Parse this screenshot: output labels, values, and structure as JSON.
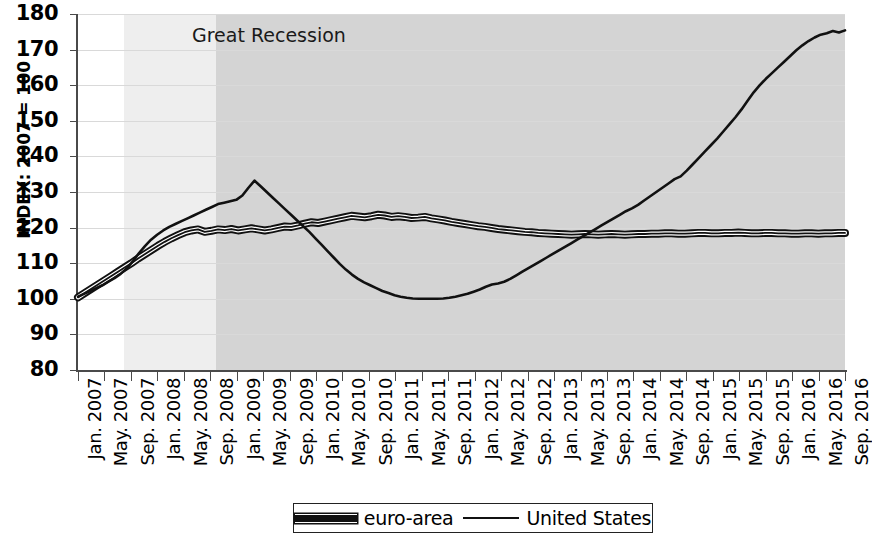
{
  "chart_data": {
    "type": "line",
    "title": "",
    "xlabel": "",
    "ylabel": "INDEX: 2007 = 100",
    "ylim": [
      80,
      180
    ],
    "ytick_values": [
      180,
      170,
      160,
      150,
      140,
      130,
      120,
      110,
      100,
      90,
      80
    ],
    "grid": true,
    "legend_position": "bottom-center",
    "tick_labels": [
      "Jan. 2007",
      "May. 2007",
      "Sep. 2007",
      "Jan. 2008",
      "May. 2008",
      "Sep. 2008",
      "Jan. 2009",
      "May. 2009",
      "Sep. 2009",
      "Jan. 2010",
      "May. 2010",
      "Sep. 2010",
      "Jan. 2011",
      "May. 2011",
      "Sep. 2011",
      "Jan. 2012",
      "May. 2012",
      "Sep. 2012",
      "Jan. 2013",
      "May. 2013",
      "Sep. 2013",
      "Jan. 2014",
      "May. 2014",
      "Sep. 2014",
      "Jan. 2015",
      "May. 2015",
      "Sep. 2015",
      "Jan. 2016",
      "May. 2016",
      "Sep. 2016"
    ],
    "x_range": [
      "Jan. 2007",
      "Sep. 2016"
    ],
    "annotations": [
      {
        "text": "Great Recession",
        "type": "shaded-band-label",
        "band_start": "Sep. 2007",
        "band_end": "Sep. 2016",
        "band_light_color": "#eeeeee",
        "band_dark_color": "#d4d4d4",
        "dark_band_start": "Sep. 2008"
      }
    ],
    "series": [
      {
        "name": "euro-area",
        "style": "thick-outlined",
        "color": "#111111",
        "values": [
          100.4,
          101.6,
          102.8,
          104.0,
          105.2,
          106.4,
          107.6,
          108.8,
          110.0,
          111.3,
          112.5,
          113.7,
          114.9,
          116.0,
          117.0,
          117.9,
          118.7,
          119.2,
          119.5,
          118.8,
          119.1,
          119.5,
          119.3,
          119.6,
          119.2,
          119.5,
          119.8,
          119.5,
          119.2,
          119.5,
          119.9,
          120.3,
          120.2,
          120.6,
          121.1,
          121.5,
          121.3,
          121.7,
          122.1,
          122.5,
          122.9,
          123.3,
          123.1,
          122.9,
          123.2,
          123.6,
          123.4,
          123.0,
          123.2,
          123.0,
          122.7,
          122.8,
          123.0,
          122.6,
          122.3,
          122.0,
          121.6,
          121.3,
          121.0,
          120.7,
          120.4,
          120.2,
          119.9,
          119.6,
          119.4,
          119.2,
          119.0,
          118.8,
          118.7,
          118.5,
          118.4,
          118.3,
          118.2,
          118.1,
          118.0,
          118.1,
          118.2,
          118.1,
          118.0,
          118.1,
          118.2,
          118.1,
          118.0,
          118.1,
          118.2,
          118.2,
          118.3,
          118.3,
          118.4,
          118.4,
          118.3,
          118.3,
          118.4,
          118.5,
          118.5,
          118.4,
          118.4,
          118.5,
          118.5,
          118.6,
          118.5,
          118.4,
          118.4,
          118.5,
          118.5,
          118.4,
          118.4,
          118.3,
          118.3,
          118.4,
          118.4,
          118.3,
          118.4,
          118.4,
          118.5,
          118.5
        ]
      },
      {
        "name": "United States",
        "style": "thin",
        "color": "#111111",
        "values": [
          100.6,
          101.4,
          102.2,
          103.0,
          103.8,
          104.8,
          105.8,
          107.0,
          108.5,
          110.5,
          112.8,
          114.8,
          116.6,
          118.0,
          119.2,
          120.2,
          121.0,
          121.8,
          122.6,
          123.4,
          124.2,
          125.0,
          125.8,
          126.6,
          127.0,
          127.4,
          127.8,
          129.0,
          131.2,
          133.2,
          131.6,
          130.0,
          128.4,
          126.8,
          125.2,
          123.6,
          122.0,
          120.4,
          118.8,
          117.0,
          115.2,
          113.4,
          111.6,
          109.8,
          108.2,
          106.8,
          105.6,
          104.6,
          103.8,
          103.0,
          102.2,
          101.6,
          101.0,
          100.6,
          100.3,
          100.1,
          100.0,
          100.0,
          100.0,
          100.0,
          100.1,
          100.3,
          100.6,
          101.0,
          101.4,
          102.0,
          102.6,
          103.4,
          104.0,
          104.3,
          104.8,
          105.6,
          106.6,
          107.6,
          108.6,
          109.6,
          110.6,
          111.6,
          112.6,
          113.6,
          114.6,
          115.6,
          116.6,
          117.6,
          118.6,
          119.6,
          120.6,
          121.6,
          122.6,
          123.6,
          124.6,
          125.4,
          126.4,
          127.6,
          128.8,
          130.0,
          131.2,
          132.4,
          133.6,
          134.4,
          136.0,
          137.8,
          139.6,
          141.4,
          143.2,
          145.0,
          147.0,
          149.0,
          151.0,
          153.2,
          155.6,
          158.0,
          160.0,
          161.8,
          163.4,
          165.0,
          166.6,
          168.2,
          169.8,
          171.2,
          172.4,
          173.4,
          174.2,
          174.6,
          175.2,
          174.8,
          175.4
        ]
      }
    ]
  },
  "axis": {
    "ylabel": "INDEX: 2007 = 100"
  },
  "legend": {
    "items": [
      {
        "label": "euro-area",
        "swatch": "thick-line-swatch"
      },
      {
        "label": "United States",
        "swatch": "thin-line-swatch"
      }
    ]
  },
  "annotation": {
    "great_recession": "Great Recession"
  }
}
